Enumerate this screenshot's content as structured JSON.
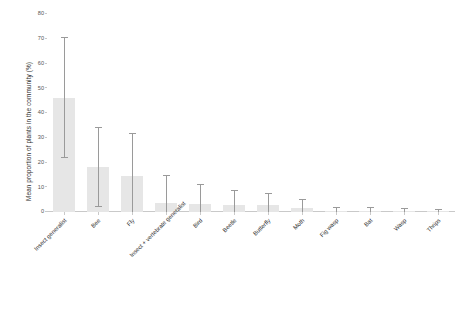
{
  "chart_data": {
    "type": "bar",
    "title": "",
    "xlabel": "",
    "ylabel": "Mean proportion of plants in the community (%)",
    "ylim": [
      0,
      80
    ],
    "yticks": [
      0,
      10,
      20,
      30,
      40,
      50,
      60,
      70,
      80
    ],
    "grid": false,
    "legend": "none",
    "orientation": "vertical",
    "error_bar_type": "range",
    "categories": [
      "Insect generalist",
      "Bee",
      "Fly",
      "Insect + vertebrate generalist",
      "Bird",
      "Beetle",
      "Butterfly",
      "Moth",
      "Fig wasp",
      "Bat",
      "Wasp",
      "Thrips"
    ],
    "values": [
      46.0,
      18.0,
      14.5,
      3.6,
      3.3,
      2.9,
      2.7,
      1.6,
      0.5,
      0.4,
      0.3,
      0.2
    ],
    "error_low": [
      22.0,
      2.0,
      0.0,
      0.0,
      0.0,
      0.0,
      0.0,
      0.0,
      0.0,
      0.0,
      0.0,
      0.0
    ],
    "error_high": [
      70.5,
      34.0,
      31.5,
      14.5,
      11.0,
      8.6,
      7.4,
      5.0,
      1.8,
      1.5,
      1.3,
      1.0
    ],
    "bar_color": "#e6e6e6",
    "error_color": "#9a9a9a",
    "axis_color": "#c9c9c9"
  },
  "axis": {
    "y_title": "Mean proportion of plants in the community (%)",
    "y_tick_labels": [
      "0",
      "10",
      "20",
      "30",
      "40",
      "50",
      "60",
      "70",
      "80"
    ]
  }
}
